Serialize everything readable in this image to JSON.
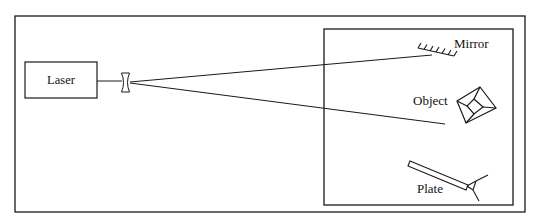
{
  "diagram": {
    "type": "holography-setup",
    "stroke_color": "#1a1a1a",
    "background_color": "#ffffff",
    "labels": {
      "laser": "Laser",
      "mirror": "Mirror",
      "object": "Object",
      "plate": "Plate"
    },
    "components": [
      {
        "id": "laser",
        "label": "Laser",
        "shape": "rectangle"
      },
      {
        "id": "lens",
        "label": "",
        "shape": "diverging-lens"
      },
      {
        "id": "mirror",
        "label": "Mirror",
        "shape": "hatched-line"
      },
      {
        "id": "object",
        "label": "Object",
        "shape": "truncated-pyramid"
      },
      {
        "id": "plate",
        "label": "Plate",
        "shape": "plate-on-holder"
      }
    ],
    "beams": [
      {
        "from": "lens",
        "to": "mirror"
      },
      {
        "from": "lens",
        "to": "object"
      }
    ]
  }
}
